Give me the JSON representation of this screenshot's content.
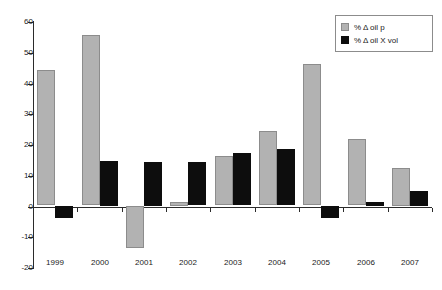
{
  "chart_data": {
    "type": "bar",
    "title": "",
    "subtitle": "",
    "xlabel": "",
    "ylabel": "",
    "categories": [
      "1999",
      "2000",
      "2001",
      "2002",
      "2003",
      "2004",
      "2005",
      "2006",
      "2007"
    ],
    "series": [
      {
        "name": "% Δ oil p",
        "color": "#b2b2b2",
        "values": [
          44,
          55.3,
          -13.5,
          1.2,
          16,
          24.2,
          46,
          21.5,
          12.3
        ]
      },
      {
        "name": "% Δ oil X vol",
        "color": "#0d0d0d",
        "values": [
          -4,
          14.5,
          14.2,
          14,
          17,
          18.3,
          -4,
          1.2,
          4.8
        ]
      }
    ],
    "ylim": [
      -20,
      60
    ],
    "ytick_step": 10,
    "yticks": [
      60,
      50,
      40,
      30,
      20,
      10,
      0,
      -10,
      -20
    ],
    "ytick_labels": [
      "60",
      "50",
      "40",
      "30",
      "20",
      "10",
      "0",
      "-10",
      "-20"
    ],
    "grid": false,
    "legend_position": "top-right",
    "zero_line": 0
  },
  "legend": {
    "entries": [
      {
        "label": "% Δ oil p"
      },
      {
        "label": "% Δ oil X vol"
      }
    ]
  },
  "colors": {
    "series_0": "#b2b2b2",
    "series_0_border": "#8c8c8c",
    "series_1": "#0d0d0d",
    "axis": "#2b2b2b",
    "text": "#1a1a1a",
    "background": "#ffffff"
  }
}
